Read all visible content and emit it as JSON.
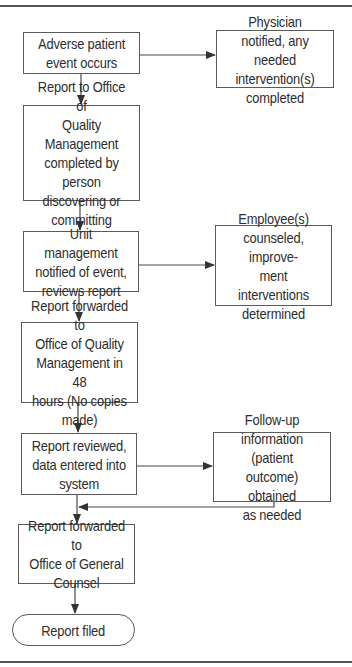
{
  "diagram": {
    "title_partial": "",
    "colors": {
      "line": "#4a4a4a",
      "box_border": "#5a5a5a",
      "text": "#2e2e2e",
      "background": "#ffffff"
    },
    "main_flow": [
      {
        "id": "adverse-event",
        "label": "Adverse patient\nevent occurs"
      },
      {
        "id": "report-to-oqm",
        "label": "Report to Office of\nQuality Management\ncompleted by person\ndiscovering or\ncommitting"
      },
      {
        "id": "unit-management",
        "label": "Unit management\nnotified of event,\nreviews report"
      },
      {
        "id": "report-forwarded-oqm",
        "label": "Report forwarded to\nOffice of Quality\nManagement in 48\nhours (No copies made)"
      },
      {
        "id": "report-reviewed",
        "label": "Report reviewed,\ndata entered into\nsystem"
      },
      {
        "id": "report-forwarded-counsel",
        "label": "Report forwarded to\nOffice of General\nCounsel"
      },
      {
        "id": "report-filed",
        "label": "Report filed",
        "shape": "terminal"
      }
    ],
    "side_boxes": [
      {
        "id": "physician-notified",
        "label": "Physician notified, any\nneeded intervention(s)\ncompleted",
        "from": "adverse-event"
      },
      {
        "id": "employee-counseled",
        "label": "Employee(s)\ncounseled, improve-\nment interventions\ndetermined",
        "from": "unit-management"
      },
      {
        "id": "follow-up-info",
        "label": "Follow-up\ninformation (patient\noutcome) obtained\nas needed",
        "from": "report-reviewed",
        "returns_to": "between report-reviewed and report-forwarded-counsel"
      }
    ]
  }
}
